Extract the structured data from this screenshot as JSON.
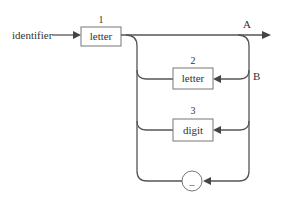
{
  "diagram": {
    "type": "syntax-diagram",
    "entry_label": "identifier",
    "nodes": [
      {
        "id": "1",
        "number": "1",
        "label": "letter",
        "shape": "rect"
      },
      {
        "id": "2",
        "number": "2",
        "label": "letter",
        "shape": "rect"
      },
      {
        "id": "3",
        "number": "3",
        "label": "digit",
        "shape": "rect"
      },
      {
        "id": "underscore",
        "number": "",
        "label": "_",
        "shape": "circle"
      }
    ],
    "point_labels": {
      "a": "A",
      "b": "B"
    },
    "colors": {
      "line": "#555555",
      "box_border": "#777777",
      "text": "#333333"
    }
  }
}
